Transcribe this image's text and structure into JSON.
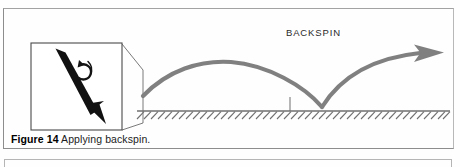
{
  "figure": {
    "caption_label": "Figure 14",
    "caption_text": " Applying backspin.",
    "backspin_label": "BACKSPIN",
    "colors": {
      "trajectory": "#808080",
      "ground": "#6f6f6f",
      "frame": "#8d8d8d",
      "arrow_fill": "#111111",
      "caption": "#1b1b1b"
    },
    "inset": {
      "name": "backspin-detail-inset",
      "strike_arrow_direction": "down-right",
      "spin_arrow_direction": "counter-clockwise"
    },
    "trajectory": {
      "launch_point": [
        143,
        96
      ],
      "first_apex": [
        231,
        62
      ],
      "bounce_point": [
        322,
        107
      ],
      "tip_point": [
        443,
        53
      ],
      "ground_y": 111,
      "tick_x": 290
    }
  }
}
